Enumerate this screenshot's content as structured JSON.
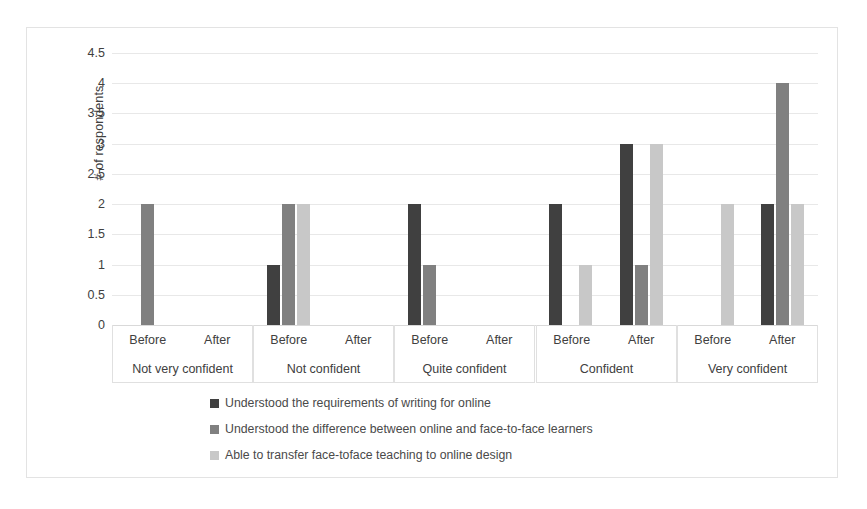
{
  "figure": {
    "caption_faint": "",
    "border_color": "#e3e3e3"
  },
  "colors": {
    "series1": "#404040",
    "series2": "#808080",
    "series3": "#c8c8c8",
    "gridline": "#e8e8e8",
    "text": "#404040"
  },
  "chart_data": {
    "type": "bar",
    "title": "",
    "xlabel": "",
    "ylabel": "# of respondents",
    "ylim": [
      0,
      4.5
    ],
    "ytick_labels": [
      "4.5",
      "4",
      "3.5",
      "3",
      "2.5",
      "2",
      "1.5",
      "1",
      "0.5",
      "0"
    ],
    "ytick_values": [
      4.5,
      4,
      3.5,
      3,
      2.5,
      2,
      1.5,
      1,
      0.5,
      0
    ],
    "grid": true,
    "legend_position": "bottom",
    "group_labels": [
      "Not very confident",
      "Not confident",
      "Quite confident",
      "Confident",
      "Very confident"
    ],
    "sub_labels": [
      "Before",
      "After"
    ],
    "categories": [
      "Not very confident / Before",
      "Not very confident / After",
      "Not confident / Before",
      "Not confident / After",
      "Quite confident / Before",
      "Quite confident / After",
      "Confident / Before",
      "Confident / After",
      "Very confident / Before",
      "Very confident / After"
    ],
    "series": [
      {
        "name": "Understood the requirements of writing for online",
        "color": "#404040",
        "values": [
          0,
          0,
          1,
          0,
          2,
          0,
          2,
          3,
          0,
          2
        ]
      },
      {
        "name": "Understood the difference between online and face-to-face learners",
        "color": "#808080",
        "values": [
          2,
          0,
          2,
          0,
          1,
          0,
          0,
          1,
          0,
          4
        ]
      },
      {
        "name": "Able to transfer face-toface teaching to online design",
        "color": "#c8c8c8",
        "values": [
          0,
          0,
          2,
          0,
          0,
          0,
          1,
          3,
          2,
          2
        ]
      }
    ]
  },
  "legend": {
    "items": [
      {
        "label": "Understood the requirements of writing for online",
        "color": "#404040",
        "swatch_name": "legend-swatch-series1"
      },
      {
        "label": "Understood the difference between online and face-to-face learners",
        "color": "#808080",
        "swatch_name": "legend-swatch-series2"
      },
      {
        "label": "Able to transfer face-toface teaching to online design",
        "color": "#c8c8c8",
        "swatch_name": "legend-swatch-series3"
      }
    ]
  }
}
